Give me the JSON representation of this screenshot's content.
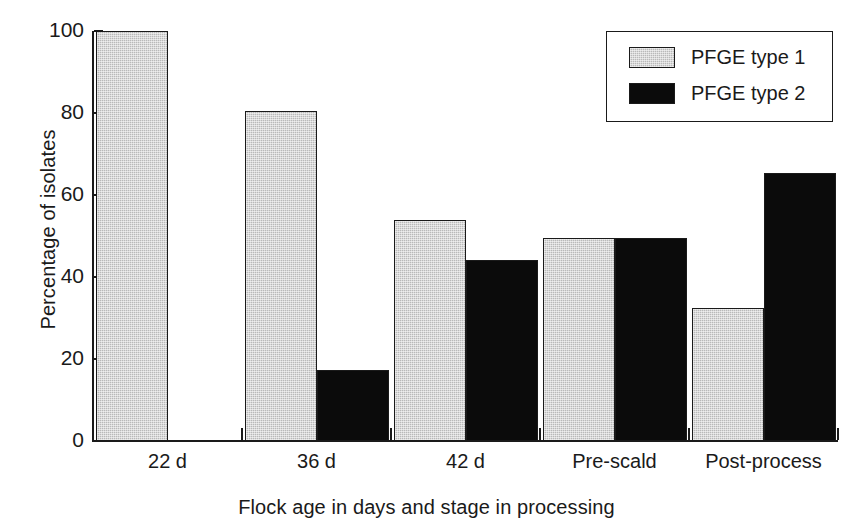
{
  "chart_data": {
    "type": "bar",
    "title": "",
    "subtitle": "",
    "xlabel": "Flock age in days and stage in processing",
    "ylabel": "Percentage of isolates",
    "categories": [
      "22 d",
      "36 d",
      "42 d",
      "Pre-scald",
      "Post-process"
    ],
    "series": [
      {
        "name": "PFGE type 1",
        "color": "#b9b9b9",
        "values": [
          100,
          80.5,
          54,
          49.4,
          32.4
        ]
      },
      {
        "name": "PFGE type 2",
        "color": "#0b0b0b",
        "values": [
          0,
          17.3,
          44.1,
          49.4,
          65.4
        ]
      }
    ],
    "ylim": [
      0,
      100
    ],
    "yticks": [
      0,
      20,
      40,
      60,
      80,
      100
    ],
    "ytick_labels": [
      "0",
      "20",
      "40",
      "60",
      "80",
      "100"
    ],
    "grid": false,
    "legend_position": "top-right"
  },
  "legend": {
    "entries": [
      {
        "label": "PFGE type 1"
      },
      {
        "label": "PFGE type 2"
      }
    ]
  }
}
